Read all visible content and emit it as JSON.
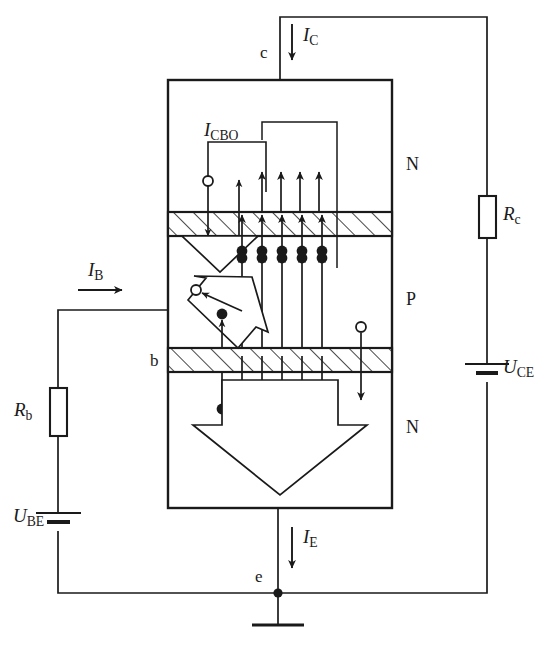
{
  "figure": {
    "kind": "npn-transistor-carrier-flow-circuit",
    "terminals": {
      "collector": "c",
      "base": "b",
      "emitter": "e"
    },
    "regions": [
      {
        "name": "collector-region",
        "doping": "N"
      },
      {
        "name": "base-region",
        "doping": "P"
      },
      {
        "name": "emitter-region",
        "doping": "N"
      }
    ],
    "currents": {
      "collector": {
        "symbol": "I",
        "sub": "C"
      },
      "base": {
        "symbol": "I",
        "sub": "B"
      },
      "emitter": {
        "symbol": "I",
        "sub": "E"
      },
      "leakage": {
        "symbol": "I",
        "sub": "CBO"
      }
    },
    "components": {
      "collector_resistor": {
        "symbol": "R",
        "sub": "c"
      },
      "base_resistor": {
        "symbol": "R",
        "sub": "b"
      },
      "collector_emitter_source": {
        "symbol": "U",
        "sub": "CE"
      },
      "base_emitter_source": {
        "symbol": "U",
        "sub": "BE"
      }
    },
    "carriers": {
      "electron_glyph": "filled-dot",
      "hole_glyph": "hollow-circle",
      "electron_columns_base": 5,
      "electron_columns_collector": 4
    },
    "colors": {
      "line": "#1a1a1a",
      "fill": "#ffffff",
      "hatch": "#1a1a1a"
    }
  }
}
